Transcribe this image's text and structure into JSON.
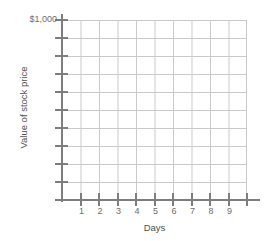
{
  "chart_data": {
    "type": "line",
    "title": "",
    "subtitle": "",
    "xlabel": "Days",
    "ylabel": "Value of stock price",
    "x_tick_labels": [
      "1",
      "2",
      "3",
      "4",
      "5",
      "6",
      "7",
      "8",
      "9"
    ],
    "x_tick_count": 10,
    "y_tick_count": 10,
    "y_top_label": "$1,000",
    "y_tick_labels": [
      "$1,000",
      "",
      "",
      "",
      "",
      "",
      "",
      "",
      "",
      ""
    ],
    "xlim": [
      0,
      10
    ],
    "ylim": [
      0,
      1000
    ],
    "grid": true,
    "grid_columns": 10,
    "grid_rows": 10,
    "legend": false,
    "legend_position": "none",
    "series": [],
    "values": [],
    "annotations": [],
    "note": "Empty grid; no data plotted",
    "colors": {
      "grid": "#c9c9c9",
      "axis": "#7d7d7d",
      "tick_label": "#6c6c6c",
      "axis_title": "#4f4f4f",
      "background": "#ffffff"
    }
  }
}
